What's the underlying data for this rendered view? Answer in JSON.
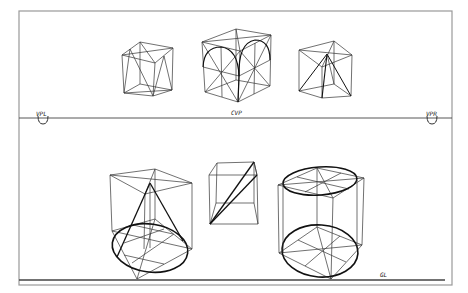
{
  "drawing": {
    "title": "Two-point perspective cube studies",
    "labels": {
      "vpl": "VPL",
      "cvp": "CVP",
      "vpr": "VPR",
      "gl": "GL"
    },
    "figures": [
      {
        "id": "cube-diagonals",
        "description": "Cube with face diagonals (top left)"
      },
      {
        "id": "cube-arches",
        "description": "Cube with semicircular arches on faces (top center)"
      },
      {
        "id": "cube-pyramid",
        "description": "Cube enclosing a pyramid (top right)"
      },
      {
        "id": "cone-in-cube",
        "description": "Cone inscribed in a cube with ellipse base (bottom left)"
      },
      {
        "id": "cube-plane",
        "description": "Cube with diagonal plane (bottom center)"
      },
      {
        "id": "cylinder-in-cube",
        "description": "Cylinder inscribed in a cube (bottom right)"
      }
    ],
    "colors": {
      "line": "#222222",
      "frame": "#999999",
      "background": "#ffffff"
    }
  }
}
